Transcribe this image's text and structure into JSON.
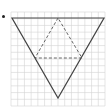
{
  "figure": {
    "bullet": "•",
    "grid": {
      "x0": 11,
      "y0": 12,
      "x1": 105,
      "y1": 106,
      "cell": 6.7,
      "color": "#d4d4d4"
    },
    "outer_triangle": {
      "style": "solid",
      "color": "#444444",
      "vertices": [
        [
          12,
          18
        ],
        [
          104,
          18
        ],
        [
          58,
          98
        ]
      ]
    },
    "inner_triangle": {
      "style": "dashed",
      "color": "#555555",
      "vertices": [
        [
          58,
          18
        ],
        [
          35,
          58
        ],
        [
          82,
          58
        ]
      ]
    }
  }
}
